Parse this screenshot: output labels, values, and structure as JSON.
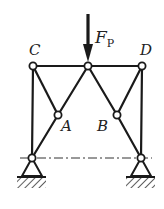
{
  "diagram": {
    "colors": {
      "line": "#1a1a1a",
      "background": "#ffffff",
      "label": "#222222"
    },
    "force": {
      "label_main": "F",
      "label_sub": "P",
      "direction": "down"
    },
    "joints": {
      "C": {
        "label": "C",
        "x": 33,
        "y": 66
      },
      "E": {
        "label": "",
        "x": 88,
        "y": 66
      },
      "D": {
        "label": "D",
        "x": 142,
        "y": 66
      },
      "A": {
        "label": "A",
        "x": 58,
        "y": 115
      },
      "B": {
        "label": "B",
        "x": 117,
        "y": 115
      },
      "O1": {
        "label": "",
        "x": 32,
        "y": 158
      },
      "O2": {
        "label": "",
        "x": 141,
        "y": 158
      }
    },
    "labels": {
      "C": "C",
      "D": "D",
      "A": "A",
      "B": "B"
    },
    "supports": [
      {
        "type": "pin",
        "joint": "O1"
      },
      {
        "type": "pin",
        "joint": "O2"
      }
    ],
    "centerline": {
      "style": "dash-dot",
      "y": 158,
      "x1": 20,
      "x2": 152
    }
  }
}
